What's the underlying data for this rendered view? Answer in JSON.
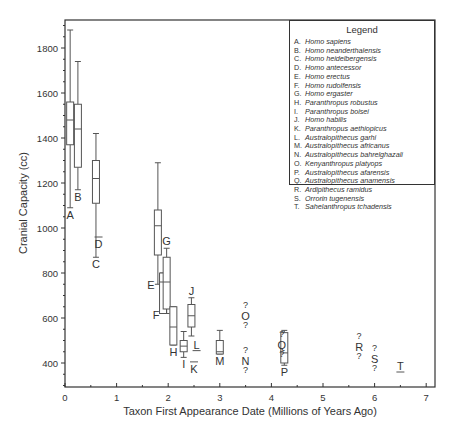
{
  "chart_data": {
    "type": "boxplot",
    "title": "",
    "xlabel": "Taxon First Appearance Date (Millions of Years Ago)",
    "ylabel": "Cranial Capacity (cc)",
    "xlim": [
      0,
      7.2
    ],
    "ylim": [
      300,
      1925
    ],
    "xticks": [
      0,
      1,
      2,
      3,
      4,
      5,
      6,
      7
    ],
    "yticks": [
      400,
      600,
      800,
      1000,
      1200,
      1400,
      1600,
      1800
    ],
    "grid": false,
    "legend_position": "upper right",
    "boxes": [
      {
        "label": "A",
        "x": 0.1,
        "whisker_high": 1880,
        "q3": 1560,
        "median": 1480,
        "q1": 1370,
        "whisker_low": 1090,
        "label_pos": "below"
      },
      {
        "label": "B",
        "x": 0.25,
        "whisker_high": 1740,
        "q3": 1550,
        "median": 1440,
        "q1": 1270,
        "whisker_low": 1170,
        "label_pos": "below"
      },
      {
        "label": "C",
        "x": 0.6,
        "whisker_high": 1420,
        "q3": 1300,
        "median": 1220,
        "q1": 1110,
        "whisker_low": 870,
        "label_pos": "below"
      },
      {
        "label": "E",
        "x": 1.8,
        "whisker_high": 1290,
        "q3": 1080,
        "median": 1010,
        "q1": 880,
        "whisker_low": 750,
        "label_pos": "left"
      },
      {
        "label": "F",
        "x": 1.9,
        "whisker_high": 800,
        "q3": 800,
        "median": 760,
        "q1": 620,
        "whisker_low": 620,
        "label_pos": "left"
      },
      {
        "label": "G",
        "x": 1.97,
        "whisker_high": 910,
        "q3": 870,
        "median": 760,
        "q1": 640,
        "whisker_low": 620,
        "label_pos": "above"
      },
      {
        "label": "H",
        "x": 2.1,
        "whisker_high": 650,
        "q3": 650,
        "median": 560,
        "q1": 480,
        "whisker_low": 480,
        "label_pos": "below"
      },
      {
        "label": "I",
        "x": 2.3,
        "whisker_high": 540,
        "q3": 500,
        "median": 475,
        "q1": 450,
        "whisker_low": 425,
        "label_pos": "below"
      },
      {
        "label": "J",
        "x": 2.45,
        "whisker_high": 690,
        "q3": 660,
        "median": 610,
        "q1": 560,
        "whisker_low": 520,
        "label_pos": "above"
      },
      {
        "label": "M",
        "x": 3.0,
        "whisker_high": 545,
        "q3": 500,
        "median": 450,
        "q1": 440,
        "whisker_low": 440,
        "label_pos": "below"
      },
      {
        "label": "P",
        "x": 4.25,
        "whisker_high": 545,
        "q3": 535,
        "median": 445,
        "q1": 400,
        "whisker_low": 390,
        "label_pos": "below"
      }
    ],
    "single_values": [
      {
        "label": "D",
        "x": 0.65,
        "value": 960,
        "mark": "overline"
      },
      {
        "label": "K",
        "x": 2.5,
        "value": 405,
        "mark": "overline"
      },
      {
        "label": "L",
        "x": 2.55,
        "value": 455,
        "mark": "underline"
      },
      {
        "label": "T",
        "x": 6.5,
        "value": 360,
        "mark": "underline"
      }
    ],
    "uncertain_values": [
      {
        "label": "O",
        "x": 3.5,
        "value": 610
      },
      {
        "label": "N",
        "x": 3.5,
        "value": 410
      },
      {
        "label": "Q",
        "x": 4.2,
        "value": 480
      },
      {
        "label": "R",
        "x": 5.7,
        "value": 470
      },
      {
        "label": "S",
        "x": 6.0,
        "value": 420
      }
    ]
  },
  "legend": {
    "title": "Legend",
    "items": [
      {
        "letter": "A.",
        "name": "Homo sapiens"
      },
      {
        "letter": "B.",
        "name": "Homo neanderthalensis"
      },
      {
        "letter": "C.",
        "name": "Homo heidelbergensis"
      },
      {
        "letter": "D.",
        "name": "Homo antecessor"
      },
      {
        "letter": "E.",
        "name": "Homo erectus"
      },
      {
        "letter": "F.",
        "name": "Homo rudolfensis"
      },
      {
        "letter": "G.",
        "name": "Homo ergaster"
      },
      {
        "letter": "H.",
        "name": "Paranthropus robustus"
      },
      {
        "letter": "I.",
        "name": "Paranthropus boisei"
      },
      {
        "letter": "J.",
        "name": "Homo habilis"
      },
      {
        "letter": "K.",
        "name": "Paranthropus aethiopicus"
      },
      {
        "letter": "L.",
        "name": "Australopithecus garhi"
      },
      {
        "letter": "M.",
        "name": "Australopithecus africanus"
      },
      {
        "letter": "N.",
        "name": "Australopithecus bahrelghazali"
      },
      {
        "letter": "O.",
        "name": "Kenyanthropus platyops"
      },
      {
        "letter": "P.",
        "name": "Australopithecus afarensis"
      },
      {
        "letter": "Q.",
        "name": "Australopithecus anamensis"
      },
      {
        "letter": "R.",
        "name": "Ardipithecus ramidus"
      },
      {
        "letter": "S.",
        "name": "Orrorin tugenensis"
      },
      {
        "letter": "T.",
        "name": "Sahelanthropus tchadensis"
      }
    ]
  },
  "colors": {
    "axis": "#333333",
    "box": "#555555",
    "text": "#333333",
    "background": "#ffffff"
  }
}
